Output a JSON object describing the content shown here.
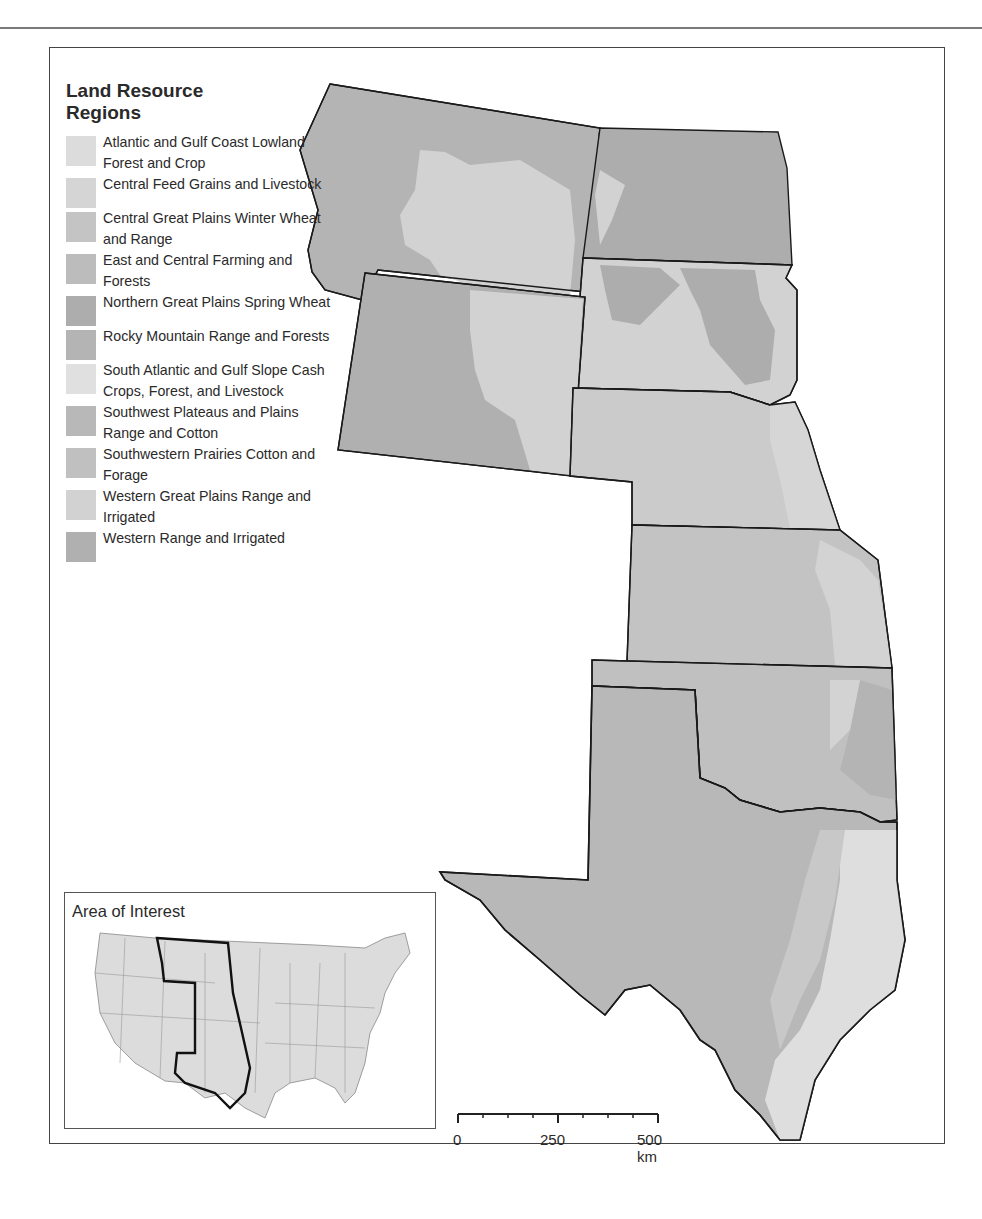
{
  "legend": {
    "title_line1": "Land Resource",
    "title_line2": "Regions",
    "items": [
      {
        "label": "Atlantic and Gulf Coast Lowland Forest and Crop",
        "color": "#dcdcdc"
      },
      {
        "label": "Central Feed Grains and Livestock",
        "color": "#d5d5d5"
      },
      {
        "label": "Central Great Plains Winter Wheat and Range",
        "color": "#c4c4c4"
      },
      {
        "label": "East and Central Farming and Forests",
        "color": "#bcbcbc"
      },
      {
        "label": "Northern Great Plains Spring Wheat",
        "color": "#adadad"
      },
      {
        "label": "Rocky Mountain Range and Forests",
        "color": "#b4b4b4"
      },
      {
        "label": "South Atlantic and Gulf Slope Cash Crops, Forest, and Livestock",
        "color": "#e0e0e0"
      },
      {
        "label": "Southwest Plateaus and Plains Range and Cotton",
        "color": "#b8b8b8"
      },
      {
        "label": "Southwestern Prairies Cotton and Forage",
        "color": "#c0c0c0"
      },
      {
        "label": "Western Great Plains Range and Irrigated",
        "color": "#d2d2d2"
      },
      {
        "label": "Western Range and Irrigated",
        "color": "#b0b0b0"
      }
    ]
  },
  "inset": {
    "title": "Area of Interest"
  },
  "scale_bar": {
    "labels": [
      "0",
      "250",
      "500 km"
    ]
  },
  "colors": {
    "border": "#1a1a1a",
    "range_dark": "#b3b3b3",
    "plains_light": "#d1d1d1",
    "winter_wheat": "#c3c3c3",
    "coast_light": "#dedede"
  }
}
